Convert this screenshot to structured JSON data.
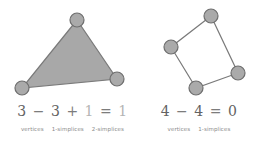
{
  "figure": {
    "background": "#ffffff",
    "shape_fill": "#a8a8a8",
    "shape_stroke": "#7a7a7a",
    "vertex_fill": "#aaaaaa",
    "vertex_stroke": "#6e6e6e",
    "text_color": "#636363",
    "faint_text_color": "#b4b4b4",
    "legend_color": "#8a8a8a"
  },
  "left": {
    "shape_name": "filled-triangle",
    "vertices": [
      {
        "label": "top",
        "cx": 77,
        "cy": 20
      },
      {
        "label": "bottom-left",
        "cx": 22,
        "cy": 88
      },
      {
        "label": "bottom-right",
        "cx": 117,
        "cy": 79
      }
    ],
    "vertex_radius": 7,
    "filled": true,
    "equation": {
      "terms": [
        "3",
        "3",
        "1",
        "1"
      ],
      "operators": [
        "−",
        "+",
        "="
      ],
      "full_text": "3 − 3 + 1 = 1"
    },
    "legend": [
      "vertices",
      "1-simplices",
      "2-simplices"
    ]
  },
  "right": {
    "shape_name": "open-quadrilateral",
    "vertices": [
      {
        "label": "top",
        "cx": 66,
        "cy": 16
      },
      {
        "label": "left",
        "cx": 26,
        "cy": 47
      },
      {
        "label": "right",
        "cx": 93,
        "cy": 73
      },
      {
        "label": "bottom",
        "cx": 51,
        "cy": 88
      }
    ],
    "vertex_radius": 7,
    "filled": false,
    "equation": {
      "terms": [
        "4",
        "4",
        "0"
      ],
      "operators": [
        "−",
        "="
      ],
      "full_text": "4 − 4 = 0"
    },
    "legend": [
      "vertices",
      "1-simplices"
    ]
  }
}
